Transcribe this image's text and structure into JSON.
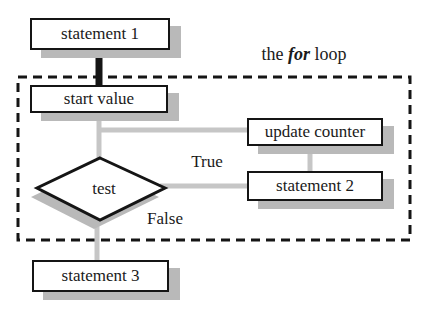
{
  "title": {
    "pre": "the ",
    "keyword": "for",
    "post": " loop"
  },
  "nodes": {
    "statement1": {
      "label": "statement 1"
    },
    "start_value": {
      "label": "start value"
    },
    "update_counter": {
      "label": "update counter"
    },
    "test": {
      "label": "test"
    },
    "statement2": {
      "label": "statement 2"
    },
    "statement3": {
      "label": "statement 3"
    }
  },
  "edge_labels": {
    "true_branch": "True",
    "false_branch": "False"
  },
  "colors": {
    "background": "#ffffff",
    "box_fill": "#ffffff",
    "box_border": "#151515",
    "shadow_gray": "#b9b9b9",
    "connector_gray": "#c6c6c6",
    "text": "#1a1a1a"
  }
}
